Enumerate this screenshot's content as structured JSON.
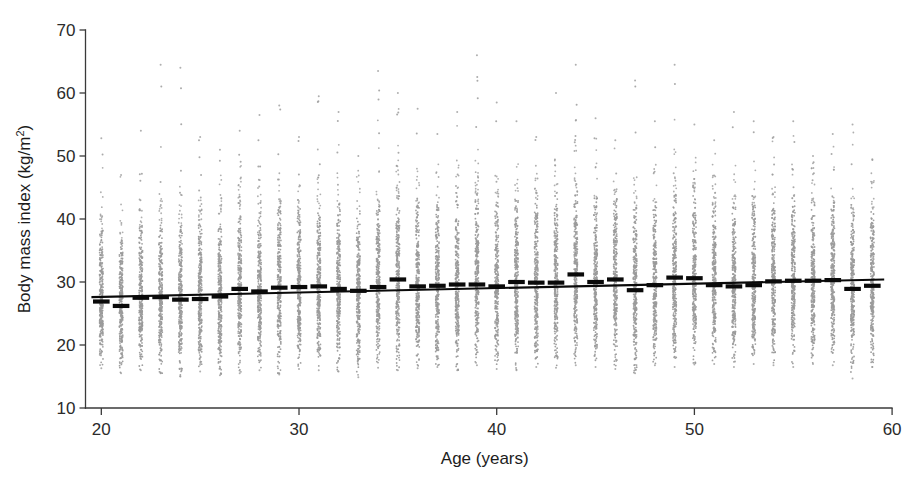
{
  "chart_data": {
    "type": "scatter",
    "title": "",
    "xlabel": "Age (years)",
    "ylabel": "Body mass index (kg/m2)",
    "ylabel_base": "Body mass index (kg/m",
    "ylabel_sup": "2",
    "ylabel_tail": ")",
    "xlim": [
      19.2,
      60.4
    ],
    "ylim": [
      10,
      70
    ],
    "xticks": [
      20,
      30,
      40,
      50,
      60
    ],
    "xtick_labels": [
      "20",
      "30",
      "40",
      "50",
      "60"
    ],
    "yticks": [
      10,
      20,
      30,
      40,
      50,
      60,
      70
    ],
    "ytick_labels": [
      "10",
      "20",
      "30",
      "40",
      "50",
      "60",
      "70"
    ],
    "grid": false,
    "legend": null,
    "dot_color": "#9b9b9b",
    "mean_color": "#0a0a0a",
    "fit_color": "#0a0a0a",
    "axis_color": "#3a3a3a",
    "categories": [
      20,
      21,
      22,
      23,
      24,
      25,
      26,
      27,
      28,
      29,
      30,
      31,
      32,
      33,
      34,
      35,
      36,
      37,
      38,
      39,
      40,
      41,
      42,
      43,
      44,
      45,
      46,
      47,
      48,
      49,
      50,
      51,
      52,
      53,
      54,
      55,
      56,
      57,
      58,
      59
    ],
    "series": [
      {
        "name": "Mean BMI by age",
        "values": [
          26.9,
          26.2,
          27.5,
          27.6,
          27.2,
          27.3,
          27.7,
          28.9,
          28.5,
          29.1,
          29.2,
          29.3,
          28.9,
          28.6,
          29.2,
          30.4,
          29.3,
          29.4,
          29.6,
          29.6,
          29.3,
          30.0,
          29.9,
          29.9,
          31.2,
          30.0,
          30.4,
          28.7,
          29.5,
          30.7,
          30.6,
          29.5,
          29.3,
          29.5,
          30.1,
          30.2,
          30.2,
          30.3,
          28.9,
          29.4
        ]
      },
      {
        "name": "Individual observations (spread per age)",
        "p05": [
          18.5,
          18.8,
          19.0,
          19.2,
          19.3,
          19.4,
          19.6,
          19.8,
          20.0,
          20.1,
          20.2,
          20.3,
          20.4,
          20.4,
          20.5,
          20.6,
          20.7,
          20.8,
          20.9,
          21.0,
          21.0,
          21.1,
          21.2,
          21.2,
          21.3,
          21.3,
          21.4,
          21.4,
          21.5,
          21.5,
          21.6,
          21.6,
          21.7,
          21.7,
          21.8,
          21.8,
          21.9,
          21.9,
          22.0,
          22.0
        ],
        "p95": [
          38.0,
          37.5,
          39.0,
          40.0,
          40.0,
          40.0,
          40.5,
          41.0,
          41.5,
          41.5,
          42.0,
          42.0,
          42.5,
          42.5,
          43.0,
          43.5,
          43.5,
          43.5,
          44.0,
          44.0,
          44.0,
          44.0,
          44.5,
          44.5,
          45.0,
          44.5,
          44.5,
          44.0,
          44.0,
          44.5,
          44.5,
          44.0,
          44.0,
          44.0,
          44.0,
          44.0,
          43.5,
          43.5,
          43.0,
          43.0
        ],
        "min": [
          16.3,
          15.5,
          16.0,
          15.5,
          15.0,
          15.8,
          15.2,
          15.5,
          16.0,
          15.3,
          16.2,
          16.0,
          15.8,
          14.9,
          16.4,
          16.0,
          16.3,
          16.5,
          16.0,
          16.8,
          16.2,
          16.0,
          16.5,
          16.4,
          16.8,
          16.5,
          16.2,
          15.5,
          16.8,
          16.5,
          16.9,
          17.0,
          16.5,
          17.0,
          16.8,
          16.5,
          17.0,
          16.8,
          14.7,
          16.5
        ],
        "max": [
          52.8,
          47.0,
          54.0,
          64.5,
          64.0,
          53.0,
          51.0,
          54.0,
          56.5,
          58.0,
          53.0,
          59.5,
          57.0,
          50.0,
          63.5,
          60.0,
          57.5,
          53.5,
          57.0,
          66.0,
          58.5,
          55.5,
          53.0,
          60.0,
          64.5,
          56.0,
          52.5,
          62.0,
          55.5,
          64.5,
          55.0,
          52.5,
          57.0,
          55.5,
          53.0,
          55.5,
          50.0,
          53.5,
          55.0,
          49.5
        ]
      }
    ],
    "fit": {
      "name": "Linear fit",
      "x_start": 20,
      "y_start": 27.6,
      "x_end": 59,
      "y_end": 30.4,
      "slope": 0.072,
      "intercept": 26.16
    }
  }
}
